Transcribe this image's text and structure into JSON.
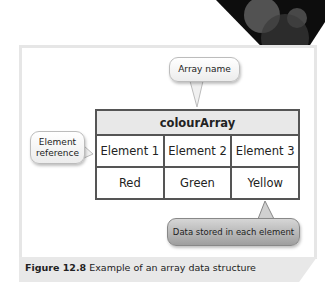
{
  "diagram": {
    "array_name": "colourArray",
    "element_refs": [
      "Element 1",
      "Element 2",
      "Element 3"
    ],
    "values": [
      "Red",
      "Green",
      "Yellow"
    ]
  },
  "callouts": {
    "array_name": "Array name",
    "element_reference": "Element reference",
    "data_stored": "Data stored in each element"
  },
  "caption": {
    "number": "Figure 12.8",
    "text": "Example of an array data structure"
  },
  "colors": {
    "table_border": "#555555",
    "header_fill": "#e8e8e8",
    "corner_dark": "#111111"
  }
}
